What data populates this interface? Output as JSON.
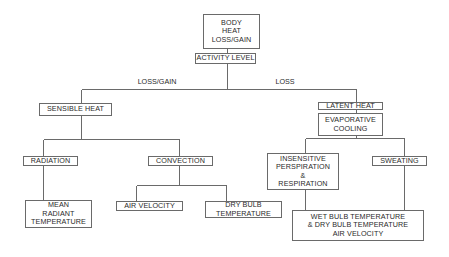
{
  "diagram": {
    "title": "Body Heat Loss/Gain",
    "nodes": {
      "body": "BODY\nHEAT\nLOSS/GAIN",
      "activity": "ACTIVITY LEVEL",
      "sensible": "SENSIBLE HEAT",
      "latent": "LATENT HEAT",
      "evaporative": "EVAPORATIVE\n    COOLING",
      "radiation": "RADIATION",
      "convection": "CONVECTION",
      "mean_radiant": "MEAN\nRADIANT\nTEMPERATURE",
      "air_velocity": "AIR VELOCITY",
      "dry_bulb": "DRY BULB\nTEMPERATURE",
      "insensitive": "INSENSITIVE\nPERSPIRATION\n&\nRESPIRATION",
      "sweating": "SWEATING",
      "wet_bulb": "WET BULB TEMPERATURE\n&  DRY BULB TEMPERATURE\nAIR VELOCITY"
    },
    "edge_labels": {
      "loss_gain": "LOSS/GAIN",
      "loss": "LOSS"
    },
    "edges": [
      [
        "body",
        "activity"
      ],
      [
        "activity",
        "sensible",
        "LOSS/GAIN"
      ],
      [
        "activity",
        "latent",
        "LOSS"
      ],
      [
        "sensible",
        "radiation"
      ],
      [
        "sensible",
        "convection"
      ],
      [
        "radiation",
        "mean_radiant"
      ],
      [
        "convection",
        "air_velocity"
      ],
      [
        "convection",
        "dry_bulb"
      ],
      [
        "latent",
        "evaporative"
      ],
      [
        "evaporative",
        "insensitive"
      ],
      [
        "evaporative",
        "sweating"
      ],
      [
        "insensitive",
        "wet_bulb"
      ],
      [
        "sweating",
        "wet_bulb"
      ]
    ],
    "colors": {
      "line": "#6a6a6a",
      "text": "#2a2a2a",
      "background": "#ffffff"
    }
  }
}
